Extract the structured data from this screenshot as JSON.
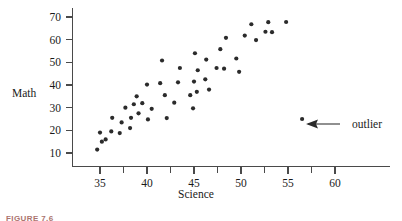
{
  "figure": {
    "caption": "FIGURE 7.6",
    "annotation_label": "outlier"
  },
  "chart_data": {
    "type": "scatter",
    "title": "",
    "xlabel": "Science",
    "ylabel": "Math",
    "xlim": [
      32,
      62
    ],
    "ylim": [
      7,
      73
    ],
    "grid": false,
    "legend": null,
    "xticks": [
      35,
      40,
      45,
      50,
      55,
      60
    ],
    "xtick_labels": [
      "35",
      "40",
      "45",
      "50",
      "55",
      "60"
    ],
    "xminor_ticks": [
      37.5,
      42.5,
      47.5,
      52.5,
      57.5
    ],
    "yticks": [
      10,
      20,
      30,
      40,
      50,
      60,
      70
    ],
    "ytick_labels": [
      "10",
      "20",
      "30",
      "40",
      "50",
      "60",
      "70"
    ],
    "annotations": [
      {
        "text": "outlier",
        "points_to_x": 56.5,
        "points_to_y": 25,
        "description": "arrow pointing at the isolated low-math high-science data point"
      }
    ],
    "series": [
      {
        "name": "students",
        "marker": "filled-circle",
        "color": "#2b2b2b",
        "points": [
          [
            34.7,
            11.5
          ],
          [
            35.0,
            19.0
          ],
          [
            35.2,
            15.0
          ],
          [
            35.6,
            16.0
          ],
          [
            36.2,
            19.5
          ],
          [
            36.3,
            25.5
          ],
          [
            37.1,
            18.8
          ],
          [
            37.3,
            23.5
          ],
          [
            37.7,
            30.0
          ],
          [
            38.2,
            21.0
          ],
          [
            38.3,
            25.5
          ],
          [
            38.6,
            31.5
          ],
          [
            38.9,
            35.0
          ],
          [
            39.1,
            27.5
          ],
          [
            39.5,
            32.0
          ],
          [
            40.0,
            40.2
          ],
          [
            40.1,
            24.8
          ],
          [
            40.5,
            29.5
          ],
          [
            41.4,
            40.8
          ],
          [
            41.6,
            50.8
          ],
          [
            41.9,
            35.5
          ],
          [
            42.1,
            25.4
          ],
          [
            42.9,
            32.2
          ],
          [
            43.3,
            41.2
          ],
          [
            43.5,
            47.5
          ],
          [
            44.6,
            35.5
          ],
          [
            44.9,
            29.7
          ],
          [
            45.0,
            41.5
          ],
          [
            45.1,
            54.0
          ],
          [
            45.3,
            37.0
          ],
          [
            45.4,
            46.5
          ],
          [
            46.2,
            42.5
          ],
          [
            46.3,
            51.2
          ],
          [
            46.6,
            38.0
          ],
          [
            47.4,
            47.5
          ],
          [
            47.8,
            55.8
          ],
          [
            48.2,
            47.2
          ],
          [
            48.4,
            60.8
          ],
          [
            49.5,
            51.7
          ],
          [
            49.8,
            45.8
          ],
          [
            50.4,
            61.8
          ],
          [
            51.1,
            66.8
          ],
          [
            51.6,
            59.8
          ],
          [
            52.6,
            63.5
          ],
          [
            52.9,
            67.7
          ],
          [
            53.3,
            63.3
          ],
          [
            54.8,
            67.8
          ],
          [
            56.5,
            25.0
          ]
        ]
      }
    ]
  }
}
